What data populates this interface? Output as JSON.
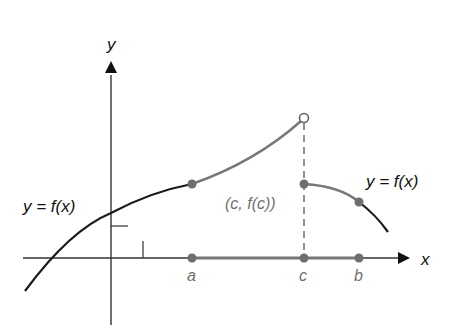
{
  "diagram": {
    "axes": {
      "x_label": "x",
      "y_label": "y"
    },
    "labels": {
      "left_function": "y = f(x)",
      "right_function": "y = f(x)",
      "point_c": "(c, f(c))",
      "a": "a",
      "c": "c",
      "b": "b"
    },
    "points": [
      {
        "name": "a_on_axis",
        "filled": true
      },
      {
        "name": "f_a",
        "filled": true
      },
      {
        "name": "limit_left_of_c",
        "filled": false
      },
      {
        "name": "c_f_c",
        "filled": true
      },
      {
        "name": "c_on_axis",
        "filled": true
      },
      {
        "name": "f_b",
        "filled": true
      },
      {
        "name": "b_on_axis",
        "filled": true
      }
    ],
    "colors": {
      "black": "#1a1a1a",
      "gray": "#707070",
      "label_gray": "#707070"
    }
  }
}
